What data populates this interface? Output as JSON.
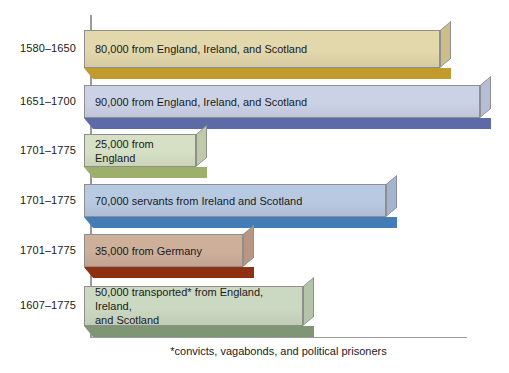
{
  "chart_data": {
    "type": "bar",
    "title": "",
    "subtitle": "",
    "xlabel": "",
    "ylabel": "",
    "orientation": "horizontal",
    "grid": false,
    "legend": "none",
    "axis_note": "Bar length is proportional to number of immigrants; no numeric axis ticks are shown.",
    "categories": [
      "1580–1650",
      "1651–1700",
      "1701–1775",
      "1701–1775",
      "1701–1775",
      "1607–1775"
    ],
    "values": [
      80000,
      90000,
      25000,
      70000,
      35000,
      50000
    ],
    "value_labels": [
      "80,000 from England, Ireland, and Scotland",
      "90,000 from England, Ireland, and Scotland",
      "25,000 from England",
      "70,000 servants from Ireland and Scotland",
      "35,000 from Germany",
      "50,000 transported* from England, Ireland,\nand Scotland"
    ],
    "colors": [
      "#e3d7ac",
      "#ccd2e6",
      "#d6e0c4",
      "#b8c9e2",
      "#cdaf9a",
      "#ccd9c2"
    ],
    "shadow_colors": [
      "#c19b2c",
      "#5d6aa8",
      "#9db06b",
      "#447cb5",
      "#8f3011",
      "#7e9673"
    ]
  },
  "footnote": {
    "text": "*convicts, vagabonds, and political prisoners"
  },
  "bars": [
    {
      "year": "1580–1650",
      "label": "80,000 from England, Ireland, and Scotland",
      "value": 80000,
      "face_color": "#e3d7ac",
      "shadow_color": "#c19b2c",
      "side_color": "#cbbd8c"
    },
    {
      "year": "1651–1700",
      "label": "90,000 from England, Ireland, and Scotland",
      "value": 90000,
      "face_color": "#ccd2e6",
      "shadow_color": "#5d6aa8",
      "side_color": "#b4bcd6"
    },
    {
      "year": "1701–1775",
      "label": "25,000 from England",
      "value": 25000,
      "face_color": "#d6e0c4",
      "shadow_color": "#9db06b",
      "side_color": "#bfcba8"
    },
    {
      "year": "1701–1775",
      "label": "70,000 servants from Ireland and Scotland",
      "value": 70000,
      "face_color": "#b8c9e2",
      "shadow_color": "#447cb5",
      "side_color": "#a2b4d2"
    },
    {
      "year": "1701–1775",
      "label": "35,000 from Germany",
      "value": 35000,
      "face_color": "#cdaf9a",
      "shadow_color": "#8f3011",
      "side_color": "#b79781"
    },
    {
      "year": "1607–1775",
      "label": "50,000 transported* from England, Ireland,\nand Scotland",
      "value": 50000,
      "face_color": "#ccd9c2",
      "shadow_color": "#7e9673",
      "side_color": "#b4c4a9"
    }
  ],
  "layout": {
    "rows": [
      {
        "top": 30,
        "face_height": 38,
        "width": 356
      },
      {
        "top": 85,
        "face_height": 33,
        "width": 396
      },
      {
        "top": 134,
        "face_height": 33,
        "width": 112
      },
      {
        "top": 184,
        "face_height": 33,
        "width": 302
      },
      {
        "top": 234,
        "face_height": 33,
        "width": 159
      },
      {
        "top": 286,
        "face_height": 40,
        "width": 219
      }
    ]
  }
}
